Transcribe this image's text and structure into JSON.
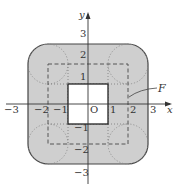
{
  "diagram": {
    "axes": {
      "x_label": "x",
      "y_label": "y",
      "origin_label": "O"
    },
    "x_ticks": [
      {
        "value": -3,
        "label": "−3"
      },
      {
        "value": -2,
        "label": "−2"
      },
      {
        "value": -1,
        "label": "−1"
      },
      {
        "value": 1,
        "label": "1"
      },
      {
        "value": 2,
        "label": "2"
      },
      {
        "value": 3,
        "label": "3"
      }
    ],
    "y_ticks": [
      {
        "value": 3,
        "label": "3"
      },
      {
        "value": 2,
        "label": "2"
      },
      {
        "value": 1,
        "label": "1"
      },
      {
        "value": -1,
        "label": "−1"
      },
      {
        "value": -2,
        "label": "−2"
      },
      {
        "value": -3,
        "label": "−3"
      }
    ],
    "region_label": "F",
    "shapes": {
      "outer_rounded_square": {
        "half_width": 3,
        "corner_radius": 1,
        "fill": "#cfcfcf",
        "stroke": "#444444"
      },
      "dashed_square": {
        "half_width": 2,
        "stroke": "#555555"
      },
      "inner_white_square": {
        "half_width": 1,
        "fill": "#ffffff",
        "stroke": "#222222"
      },
      "corner_circles": {
        "centers": [
          [
            2,
            2
          ],
          [
            -2,
            2
          ],
          [
            -2,
            -2
          ],
          [
            2,
            -2
          ]
        ],
        "radius": 1,
        "style": "dotted"
      }
    }
  }
}
